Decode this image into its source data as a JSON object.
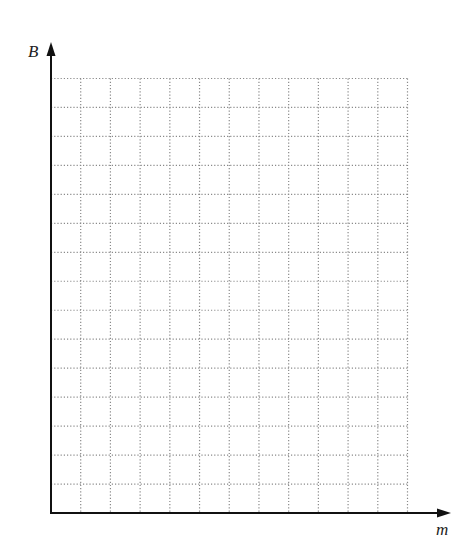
{
  "chart_data": {
    "type": "line",
    "title": "",
    "xlabel": "m",
    "ylabel": "B",
    "series": [],
    "x": [],
    "grid": true,
    "grid_style": "dotted",
    "grid_columns": 12,
    "grid_rows": 15,
    "tick_labels": {
      "x": [],
      "y": []
    },
    "legend": null,
    "note": "Blank graph grid with labelled axes; no data plotted"
  },
  "axes": {
    "x_label": "m",
    "y_label": "B"
  },
  "colors": {
    "axis": "#111111",
    "grid": "#8a8a8a",
    "label": "#222222",
    "background": "#ffffff"
  }
}
